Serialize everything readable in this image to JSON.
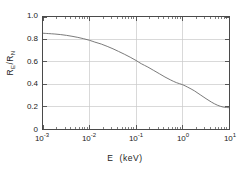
{
  "chart_data": {
    "type": "line",
    "title": "",
    "xlabel": "E  (keV)",
    "xlabel_symbol": "E",
    "xlabel_unit": "(keV)",
    "ylabel": "R_E / R_N",
    "ylabel_numerator": "R",
    "ylabel_num_sub": "E",
    "ylabel_denominator": "R",
    "ylabel_den_sub": "N",
    "xscale": "log",
    "yscale": "linear",
    "xlim": [
      0.001,
      10
    ],
    "ylim": [
      0,
      1.0
    ],
    "grid": true,
    "legend": null,
    "xticks": [
      0.001,
      0.01,
      0.1,
      1,
      10
    ],
    "xtick_labels": [
      "10⁻³",
      "10⁻²",
      "10⁻¹",
      "10⁰",
      "10¹"
    ],
    "xtick_mantissa": [
      "10",
      "10",
      "10",
      "10",
      "10"
    ],
    "xtick_exponents": [
      "-3",
      "-2",
      "-1",
      "0",
      "1"
    ],
    "yticks": [
      0,
      0.2,
      0.4,
      0.6,
      0.8,
      1.0
    ],
    "ytick_labels": [
      "0",
      "0.2",
      "0.4",
      "0.6",
      "0.8",
      "1.0"
    ],
    "series": [
      {
        "name": "R_E/R_N",
        "color": "#6b6b6b",
        "linewidth": 0.9,
        "x": [
          0.001,
          0.0013,
          0.0018,
          0.0024,
          0.0032,
          0.0042,
          0.0056,
          0.0075,
          0.01,
          0.013,
          0.018,
          0.024,
          0.032,
          0.042,
          0.056,
          0.075,
          0.1,
          0.13,
          0.18,
          0.24,
          0.32,
          0.42,
          0.56,
          0.75,
          1.0,
          1.3,
          1.8,
          2.4,
          3.2,
          4.2,
          5.6,
          7.5,
          10.0
        ],
        "y": [
          0.855,
          0.852,
          0.848,
          0.843,
          0.836,
          0.828,
          0.818,
          0.806,
          0.792,
          0.776,
          0.758,
          0.738,
          0.716,
          0.693,
          0.668,
          0.641,
          0.612,
          0.583,
          0.553,
          0.523,
          0.493,
          0.464,
          0.437,
          0.413,
          0.396,
          0.373,
          0.341,
          0.306,
          0.271,
          0.24,
          0.213,
          0.196,
          0.19
        ]
      }
    ]
  }
}
